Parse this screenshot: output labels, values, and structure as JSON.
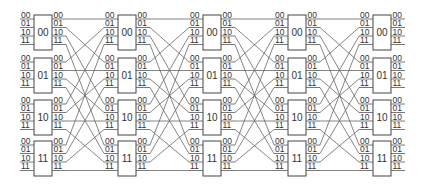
{
  "diagram": {
    "type": "trellis-network",
    "columns": 5,
    "blocks_per_column": [
      "00",
      "01",
      "10",
      "11"
    ],
    "port_labels": [
      "00",
      "01",
      "10",
      "11"
    ],
    "connection_rule": "right port p of block b connects to left port b of block p in next column",
    "colors": {
      "box_stroke": "#444444",
      "wire": "#666666",
      "text": "#333333"
    }
  }
}
